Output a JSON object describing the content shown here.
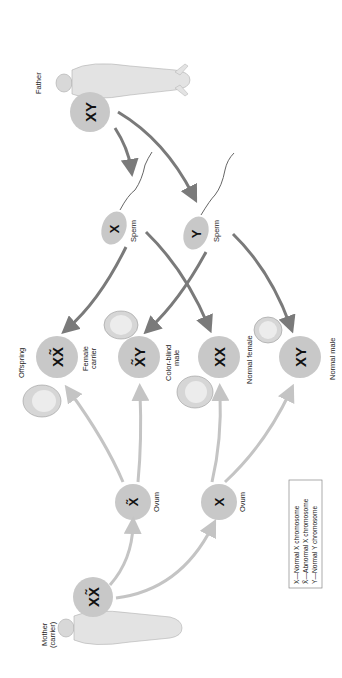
{
  "colors": {
    "circle_fill": "#c8c8c8",
    "paternal_arrow": "#7a7a7a",
    "maternal_arrow": "#c4c4c4",
    "text": "#222222",
    "figure": "#dcdcdc"
  },
  "parents": {
    "father": {
      "label": "Father",
      "genotype": "XY"
    },
    "mother": {
      "label_line1": "Mother",
      "label_line2": "(carrier)",
      "genotype": "XX̃"
    }
  },
  "gametes": {
    "sperm": [
      {
        "label": "Sperm",
        "chromosome": "X"
      },
      {
        "label": "Sperm",
        "chromosome": "Y"
      }
    ],
    "ova": [
      {
        "label": "Ovum",
        "chromosome": "X̃",
        "abnormal": true
      },
      {
        "label": "Ovum",
        "chromosome": "X",
        "abnormal": false
      }
    ]
  },
  "offspring": {
    "heading": "Offspring",
    "items": [
      {
        "genotype": "XX̃",
        "label_line1": "Female",
        "label_line2": "carrier"
      },
      {
        "genotype": "X̃Y",
        "label_line1": "Color-blind",
        "label_line2": "male"
      },
      {
        "genotype": "XX",
        "label_line1": "Normal female",
        "label_line2": ""
      },
      {
        "genotype": "XY",
        "label_line1": "Normal male",
        "label_line2": ""
      }
    ]
  },
  "legend": {
    "items": [
      "X—Normal X chromosome",
      "X̃—Abnormal X chromosome",
      "Y—Normal Y chromosome"
    ]
  }
}
